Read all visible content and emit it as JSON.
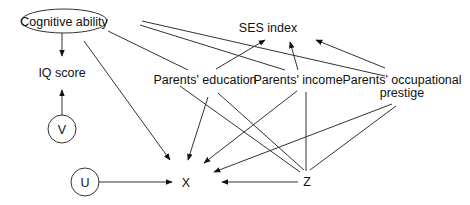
{
  "diagram": {
    "type": "causal-path-diagram",
    "nodes": {
      "cognitive_ability": {
        "label": "Cognitive ability",
        "shape": "ellipse"
      },
      "iq_score": {
        "label": "IQ score"
      },
      "v": {
        "label": "V",
        "shape": "circle"
      },
      "u": {
        "label": "U",
        "shape": "circle"
      },
      "x": {
        "label": "X"
      },
      "z": {
        "label": "Z"
      },
      "ses_index": {
        "label": "SES index"
      },
      "parents_education": {
        "label": "Parents' education"
      },
      "parents_income": {
        "label": "Parents' income"
      },
      "parents_prestige_line1": {
        "label": "Parents' occupational"
      },
      "parents_prestige_line2": {
        "label": "prestige"
      }
    },
    "edges": [
      {
        "from": "Cognitive ability",
        "to": "IQ score",
        "directed": true
      },
      {
        "from": "V",
        "to": "IQ score",
        "directed": true
      },
      {
        "from": "Cognitive ability",
        "to": "X",
        "directed": true
      },
      {
        "from": "Cognitive ability",
        "to": "Parents' education",
        "directed": false
      },
      {
        "from": "Cognitive ability",
        "to": "Parents' income",
        "directed": false
      },
      {
        "from": "Cognitive ability",
        "to": "Parents' occupational prestige",
        "directed": false
      },
      {
        "from": "Parents' education",
        "to": "SES index",
        "directed": true
      },
      {
        "from": "Parents' income",
        "to": "SES index",
        "directed": true
      },
      {
        "from": "Parents' occupational prestige",
        "to": "SES index",
        "directed": true
      },
      {
        "from": "Parents' education",
        "to": "X",
        "directed": true
      },
      {
        "from": "Parents' income",
        "to": "X",
        "directed": true
      },
      {
        "from": "Parents' occupational prestige",
        "to": "X",
        "directed": true
      },
      {
        "from": "Parents' education",
        "to": "Z",
        "directed": false
      },
      {
        "from": "Parents' income",
        "to": "Z",
        "directed": false
      },
      {
        "from": "Parents' occupational prestige",
        "to": "Z",
        "directed": false
      },
      {
        "from": "Cognitive ability",
        "to": "Z",
        "directed": false
      },
      {
        "from": "U",
        "to": "X",
        "directed": true
      },
      {
        "from": "Z",
        "to": "X",
        "directed": true
      }
    ]
  }
}
